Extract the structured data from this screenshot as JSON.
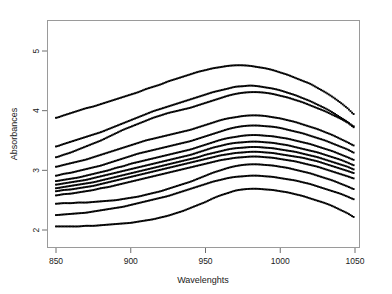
{
  "chart_data": {
    "type": "line",
    "title": "",
    "xlabel": "Wavelenghts",
    "ylabel": "Absorbances",
    "xlim": [
      850,
      1050
    ],
    "ylim": [
      1.85,
      5.45
    ],
    "xticks": [
      850,
      900,
      950,
      1000,
      1050
    ],
    "xtick_labels": [
      "850",
      "900",
      "950",
      "1000",
      "1050"
    ],
    "yticks": [
      2,
      3,
      4,
      5
    ],
    "ytick_labels": [
      "2",
      "3",
      "4",
      "5"
    ],
    "grid": false,
    "legend": false,
    "marker": "square-dot",
    "marker_color": "#000000",
    "series_count": 13,
    "x": [
      850,
      855,
      860,
      865,
      870,
      875,
      880,
      885,
      890,
      895,
      900,
      905,
      910,
      915,
      920,
      925,
      930,
      935,
      940,
      945,
      950,
      955,
      960,
      965,
      970,
      975,
      980,
      985,
      990,
      995,
      1000,
      1005,
      1010,
      1015,
      1020,
      1025,
      1030,
      1035,
      1040,
      1045,
      1050
    ],
    "series": [
      {
        "name": "spectrum-01",
        "values": [
          3.88,
          3.92,
          3.96,
          4.0,
          4.04,
          4.07,
          4.11,
          4.15,
          4.19,
          4.23,
          4.27,
          4.31,
          4.36,
          4.4,
          4.44,
          4.49,
          4.53,
          4.57,
          4.61,
          4.65,
          4.68,
          4.71,
          4.73,
          4.75,
          4.76,
          4.76,
          4.75,
          4.73,
          4.71,
          4.68,
          4.64,
          4.6,
          4.55,
          4.5,
          4.45,
          4.38,
          4.31,
          4.23,
          4.14,
          4.04,
          3.93
        ]
      },
      {
        "name": "spectrum-02",
        "values": [
          3.4,
          3.44,
          3.48,
          3.52,
          3.56,
          3.6,
          3.64,
          3.69,
          3.74,
          3.79,
          3.84,
          3.89,
          3.94,
          3.99,
          4.03,
          4.07,
          4.11,
          4.15,
          4.19,
          4.23,
          4.27,
          4.31,
          4.34,
          4.37,
          4.4,
          4.41,
          4.42,
          4.41,
          4.39,
          4.37,
          4.34,
          4.3,
          4.26,
          4.21,
          4.16,
          4.1,
          4.04,
          3.97,
          3.89,
          3.81,
          3.71
        ]
      },
      {
        "name": "spectrum-03",
        "values": [
          3.22,
          3.26,
          3.3,
          3.35,
          3.4,
          3.45,
          3.5,
          3.56,
          3.62,
          3.68,
          3.73,
          3.78,
          3.83,
          3.88,
          3.92,
          3.96,
          3.99,
          4.02,
          4.05,
          4.09,
          4.13,
          4.17,
          4.21,
          4.25,
          4.28,
          4.3,
          4.31,
          4.31,
          4.3,
          4.28,
          4.25,
          4.22,
          4.18,
          4.14,
          4.09,
          4.04,
          3.99,
          3.93,
          3.87,
          3.8,
          3.73
        ]
      },
      {
        "name": "spectrum-04",
        "values": [
          3.06,
          3.09,
          3.12,
          3.15,
          3.18,
          3.22,
          3.26,
          3.3,
          3.34,
          3.38,
          3.42,
          3.46,
          3.5,
          3.53,
          3.56,
          3.59,
          3.62,
          3.65,
          3.68,
          3.72,
          3.76,
          3.8,
          3.84,
          3.87,
          3.89,
          3.91,
          3.92,
          3.92,
          3.91,
          3.89,
          3.87,
          3.84,
          3.81,
          3.77,
          3.73,
          3.69,
          3.64,
          3.59,
          3.53,
          3.47,
          3.41
        ]
      },
      {
        "name": "spectrum-05",
        "values": [
          2.91,
          2.94,
          2.96,
          2.99,
          3.02,
          3.05,
          3.08,
          3.12,
          3.16,
          3.2,
          3.24,
          3.28,
          3.31,
          3.34,
          3.37,
          3.4,
          3.43,
          3.46,
          3.49,
          3.53,
          3.57,
          3.61,
          3.65,
          3.69,
          3.72,
          3.74,
          3.75,
          3.75,
          3.74,
          3.73,
          3.71,
          3.68,
          3.65,
          3.62,
          3.58,
          3.54,
          3.5,
          3.45,
          3.4,
          3.35,
          3.29
        ]
      },
      {
        "name": "spectrum-06",
        "values": [
          2.82,
          2.84,
          2.86,
          2.88,
          2.91,
          2.94,
          2.97,
          3.0,
          3.04,
          3.07,
          3.11,
          3.14,
          3.17,
          3.2,
          3.23,
          3.26,
          3.29,
          3.32,
          3.35,
          3.39,
          3.43,
          3.47,
          3.51,
          3.54,
          3.56,
          3.58,
          3.59,
          3.59,
          3.58,
          3.57,
          3.55,
          3.53,
          3.5,
          3.47,
          3.44,
          3.4,
          3.36,
          3.32,
          3.27,
          3.22,
          3.17
        ]
      },
      {
        "name": "spectrum-07",
        "values": [
          2.76,
          2.78,
          2.8,
          2.82,
          2.84,
          2.87,
          2.9,
          2.93,
          2.96,
          2.99,
          3.02,
          3.05,
          3.08,
          3.11,
          3.14,
          3.17,
          3.2,
          3.23,
          3.26,
          3.3,
          3.34,
          3.38,
          3.41,
          3.44,
          3.46,
          3.47,
          3.48,
          3.48,
          3.47,
          3.46,
          3.44,
          3.42,
          3.39,
          3.36,
          3.33,
          3.3,
          3.26,
          3.22,
          3.18,
          3.13,
          3.08
        ]
      },
      {
        "name": "spectrum-08",
        "values": [
          2.7,
          2.72,
          2.74,
          2.76,
          2.78,
          2.8,
          2.83,
          2.86,
          2.89,
          2.92,
          2.95,
          2.98,
          3.01,
          3.04,
          3.07,
          3.1,
          3.13,
          3.16,
          3.19,
          3.22,
          3.26,
          3.29,
          3.32,
          3.35,
          3.37,
          3.38,
          3.39,
          3.39,
          3.38,
          3.37,
          3.35,
          3.33,
          3.31,
          3.28,
          3.25,
          3.22,
          3.18,
          3.14,
          3.1,
          3.06,
          3.01
        ]
      },
      {
        "name": "spectrum-09",
        "values": [
          2.65,
          2.67,
          2.68,
          2.7,
          2.72,
          2.74,
          2.77,
          2.8,
          2.83,
          2.86,
          2.89,
          2.92,
          2.95,
          2.98,
          3.01,
          3.04,
          3.07,
          3.1,
          3.13,
          3.16,
          3.19,
          3.22,
          3.25,
          3.27,
          3.29,
          3.3,
          3.31,
          3.31,
          3.3,
          3.29,
          3.27,
          3.25,
          3.23,
          3.21,
          3.18,
          3.15,
          3.11,
          3.07,
          3.03,
          2.99,
          2.95
        ]
      },
      {
        "name": "spectrum-10",
        "values": [
          2.58,
          2.6,
          2.61,
          2.63,
          2.65,
          2.67,
          2.7,
          2.72,
          2.75,
          2.78,
          2.81,
          2.84,
          2.87,
          2.9,
          2.93,
          2.96,
          2.99,
          3.02,
          3.05,
          3.08,
          3.11,
          3.14,
          3.17,
          3.19,
          3.21,
          3.22,
          3.23,
          3.23,
          3.22,
          3.21,
          3.19,
          3.17,
          3.15,
          3.12,
          3.09,
          3.06,
          3.02,
          2.98,
          2.94,
          2.9,
          2.86
        ]
      },
      {
        "name": "spectrum-11",
        "values": [
          2.44,
          2.45,
          2.45,
          2.46,
          2.46,
          2.47,
          2.48,
          2.49,
          2.5,
          2.52,
          2.54,
          2.56,
          2.59,
          2.62,
          2.65,
          2.69,
          2.73,
          2.77,
          2.81,
          2.86,
          2.91,
          2.96,
          3.0,
          3.04,
          3.07,
          3.09,
          3.1,
          3.1,
          3.09,
          3.08,
          3.06,
          3.04,
          3.01,
          2.98,
          2.95,
          2.91,
          2.87,
          2.83,
          2.78,
          2.73,
          2.68
        ]
      },
      {
        "name": "spectrum-12",
        "values": [
          2.25,
          2.26,
          2.27,
          2.28,
          2.29,
          2.31,
          2.33,
          2.35,
          2.37,
          2.39,
          2.42,
          2.45,
          2.48,
          2.51,
          2.54,
          2.57,
          2.61,
          2.65,
          2.69,
          2.73,
          2.77,
          2.81,
          2.84,
          2.87,
          2.89,
          2.9,
          2.91,
          2.91,
          2.9,
          2.89,
          2.87,
          2.85,
          2.83,
          2.8,
          2.77,
          2.73,
          2.69,
          2.65,
          2.61,
          2.56,
          2.51
        ]
      },
      {
        "name": "spectrum-13",
        "values": [
          2.06,
          2.06,
          2.06,
          2.06,
          2.07,
          2.07,
          2.08,
          2.09,
          2.1,
          2.11,
          2.12,
          2.14,
          2.16,
          2.18,
          2.21,
          2.24,
          2.28,
          2.32,
          2.37,
          2.42,
          2.47,
          2.53,
          2.58,
          2.62,
          2.66,
          2.68,
          2.69,
          2.69,
          2.68,
          2.67,
          2.65,
          2.63,
          2.6,
          2.57,
          2.53,
          2.49,
          2.45,
          2.4,
          2.34,
          2.28,
          2.21
        ]
      }
    ]
  }
}
